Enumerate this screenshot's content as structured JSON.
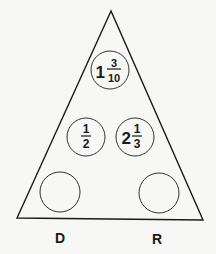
{
  "diagram": {
    "type": "fraction triangle puzzle",
    "circles": {
      "top": {
        "whole": "1",
        "numerator": "3",
        "denominator": "10"
      },
      "middle_left": {
        "whole": "",
        "numerator": "1",
        "denominator": "2"
      },
      "middle_right": {
        "whole": "2",
        "numerator": "1",
        "denominator": "3"
      },
      "bottom_left": {
        "whole": "",
        "numerator": "",
        "denominator": ""
      },
      "bottom_right": {
        "whole": "",
        "numerator": "",
        "denominator": ""
      }
    },
    "labels": {
      "left": "D",
      "right": "R"
    },
    "colors": {
      "line": "#1a1a1a",
      "background": "#f7f7f5"
    }
  }
}
